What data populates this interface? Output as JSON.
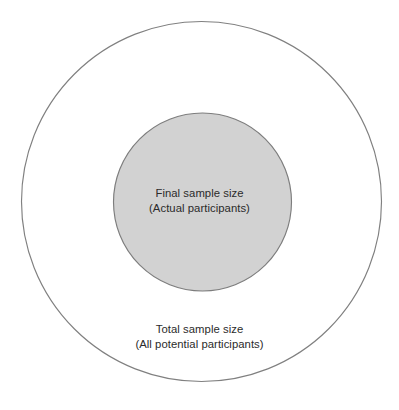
{
  "figure": {
    "type": "nested-circles-euler-diagram",
    "background_color": "#ffffff",
    "outer_region": {
      "name": "total-sample",
      "label_line1": "Total sample size",
      "label_line2": "(All potential participants)",
      "fill_color": "#ffffff",
      "stroke_color": "#808080",
      "center_x": 201.5,
      "center_y": 201.5,
      "radius": 180.5
    },
    "inner_region": {
      "name": "final-sample",
      "label_line1": "Final sample size",
      "label_line2": "(Actual participants)",
      "fill_color": "#d2d2d2",
      "stroke_color": "#7d7d7d",
      "center_x": 202.5,
      "center_y": 202,
      "radius": 89.5
    },
    "text_color": "#2b2b2b"
  },
  "chart_data": {
    "type": "pie",
    "title": "",
    "subtitle": "",
    "xlabel": "",
    "ylabel": "",
    "grid": false,
    "legend_position": "none",
    "layout": "concentric-nested-circles",
    "categories": [
      "Total sample size (All potential participants)",
      "Final sample size (Actual participants)"
    ],
    "series": [
      {
        "name": "Radius (px)",
        "values": [
          180.5,
          89.5
        ]
      },
      {
        "name": "Relative area (proportion of outer circle)",
        "values": [
          1.0,
          0.246
        ]
      }
    ],
    "annotations": [
      {
        "text": "Final sample size",
        "target": "inner-circle",
        "position": "center"
      },
      {
        "text": "(Actual participants)",
        "target": "inner-circle",
        "position": "center"
      },
      {
        "text": "Total sample size",
        "target": "outer-circle",
        "position": "lower-center"
      },
      {
        "text": "(All potential participants)",
        "target": "outer-circle",
        "position": "lower-center"
      }
    ]
  }
}
